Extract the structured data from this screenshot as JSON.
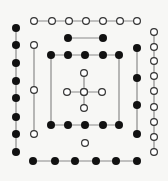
{
  "colors": {
    "background": "#f7f7f5",
    "line": "#8a8a8a",
    "filled": "#111111",
    "open_stroke": "#333333",
    "open_fill": "#ffffff"
  },
  "radius": 4,
  "chains": [
    {
      "name": "top-open-row",
      "kind": "open",
      "points": [
        [
          34,
          21
        ],
        [
          52,
          21
        ],
        [
          69,
          21
        ],
        [
          86,
          21
        ],
        [
          103,
          21
        ],
        [
          120,
          21
        ],
        [
          137,
          21
        ]
      ]
    },
    {
      "name": "left-filled-column",
      "kind": "filled",
      "points": [
        [
          16,
          28
        ],
        [
          16,
          45
        ],
        [
          16,
          63
        ],
        [
          16,
          81
        ],
        [
          16,
          98
        ],
        [
          16,
          117
        ],
        [
          16,
          134
        ],
        [
          16,
          152
        ]
      ]
    },
    {
      "name": "inner-left-open-column",
      "kind": "open",
      "points": [
        [
          34,
          45
        ],
        [
          34,
          90
        ],
        [
          34,
          134
        ]
      ]
    },
    {
      "name": "upper-filled-pair",
      "kind": "filled",
      "points": [
        [
          68,
          38
        ],
        [
          103,
          38
        ]
      ]
    },
    {
      "name": "square-top-row",
      "kind": "filled",
      "points": [
        [
          51,
          55
        ],
        [
          68,
          55
        ],
        [
          85,
          55
        ],
        [
          103,
          55
        ],
        [
          119,
          55
        ]
      ]
    },
    {
      "name": "square-left-side",
      "kind": "line",
      "points": [
        [
          51,
          55
        ],
        [
          51,
          125
        ]
      ]
    },
    {
      "name": "square-right-side",
      "kind": "line",
      "points": [
        [
          119,
          55
        ],
        [
          119,
          125
        ]
      ]
    },
    {
      "name": "square-bottom-row",
      "kind": "filled",
      "points": [
        [
          51,
          125
        ],
        [
          68,
          125
        ],
        [
          85,
          125
        ],
        [
          103,
          125
        ],
        [
          119,
          125
        ]
      ]
    },
    {
      "name": "cross-horizontal",
      "kind": "open",
      "points": [
        [
          67,
          92
        ],
        [
          84,
          92
        ],
        [
          102,
          92
        ]
      ]
    },
    {
      "name": "cross-vertical",
      "kind": "open",
      "points": [
        [
          84,
          73
        ],
        [
          84,
          92
        ],
        [
          84,
          108
        ]
      ]
    },
    {
      "name": "lone-open",
      "kind": "open",
      "points": [
        [
          85,
          143
        ]
      ]
    },
    {
      "name": "right-filled-column",
      "kind": "filled",
      "points": [
        [
          137,
          48
        ],
        [
          137,
          78
        ],
        [
          137,
          105
        ],
        [
          137,
          134
        ]
      ]
    },
    {
      "name": "right-open-column",
      "kind": "open",
      "points": [
        [
          154,
          32
        ],
        [
          154,
          47
        ],
        [
          154,
          61
        ],
        [
          154,
          76
        ],
        [
          154,
          91
        ],
        [
          154,
          107
        ],
        [
          154,
          122
        ],
        [
          154,
          137
        ],
        [
          154,
          152
        ]
      ]
    },
    {
      "name": "bottom-filled-row",
      "kind": "filled",
      "points": [
        [
          33,
          161
        ],
        [
          55,
          161
        ],
        [
          75,
          161
        ],
        [
          96,
          161
        ],
        [
          116,
          161
        ],
        [
          137,
          161
        ]
      ]
    }
  ]
}
